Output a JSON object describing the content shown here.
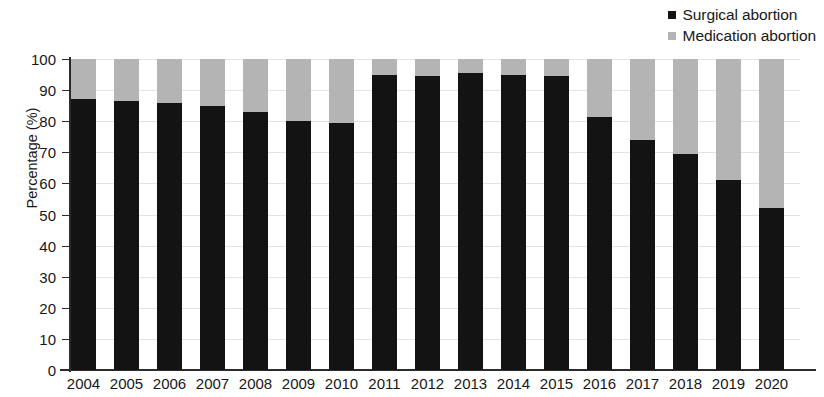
{
  "legend": {
    "position": "top-right",
    "items": [
      {
        "label": "Surgical abortion",
        "color": "#131313",
        "marker": "square"
      },
      {
        "label": "Medication abortion",
        "color": "#b4b4b4",
        "marker": "square"
      }
    ]
  },
  "axes": {
    "y_title": "Percentage (%)",
    "y_ticks": [
      "100",
      "90",
      "80",
      "70",
      "60",
      "50",
      "40",
      "30",
      "20",
      "10",
      "0"
    ],
    "x_title": ""
  },
  "chart_data": {
    "type": "bar",
    "subtype": "stacked-100-percent",
    "title": "",
    "subtitle": "",
    "xlabel": "",
    "ylabel": "Percentage (%)",
    "ylim": [
      0,
      100
    ],
    "ytick_step": 10,
    "grid": true,
    "grid_axis": "y",
    "legend_position": "top-right",
    "categories": [
      "2004",
      "2005",
      "2006",
      "2007",
      "2008",
      "2009",
      "2010",
      "2011",
      "2012",
      "2013",
      "2014",
      "2015",
      "2016",
      "2017",
      "2018",
      "2019",
      "2020"
    ],
    "series": [
      {
        "name": "Surgical abortion",
        "color": "#131313",
        "values": [
          87,
          86.5,
          86,
          85,
          83,
          80,
          79.5,
          95,
          94.5,
          95.5,
          95,
          94.5,
          81.5,
          74,
          69.5,
          61,
          52
        ]
      },
      {
        "name": "Medication abortion",
        "color": "#b4b4b4",
        "values": [
          13,
          13.5,
          14,
          15,
          17,
          20,
          20.5,
          5,
          5.5,
          4.5,
          5,
          5.5,
          18.5,
          26,
          30.5,
          39,
          48
        ]
      }
    ],
    "annotations": []
  }
}
